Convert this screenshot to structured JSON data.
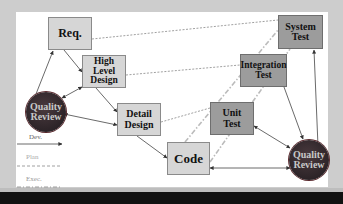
{
  "diagram": {
    "type": "V-model software development process",
    "nodes": {
      "req": {
        "label": "Req."
      },
      "high_level_design": {
        "label_line1": "High Level",
        "label_line2": "Design"
      },
      "detail_design": {
        "label_line1": "Detail",
        "label_line2": "Design"
      },
      "code": {
        "label": "Code"
      },
      "unit_test": {
        "label_line1": "Unit",
        "label_line2": "Test"
      },
      "integration_test": {
        "label_line1": "Integration",
        "label_line2": "Test"
      },
      "system_test": {
        "label_line1": "System",
        "label_line2": "Test"
      },
      "quality_review_left": {
        "label_line1": "Quality",
        "label_line2": "Review"
      },
      "quality_review_right": {
        "label_line1": "Quality",
        "label_line2": "Review"
      }
    },
    "legend": [
      {
        "label": "Dev.",
        "style": "solid-arrow"
      },
      {
        "label": "Plan",
        "style": "dashed"
      },
      {
        "label": "Exec.",
        "style": "dash-dot"
      }
    ],
    "edges": [
      {
        "from": "Req.",
        "to": "High Level Design",
        "style": "solid-arrow"
      },
      {
        "from": "High Level Design",
        "to": "Detail Design",
        "style": "solid-arrow"
      },
      {
        "from": "Detail Design",
        "to": "Code",
        "style": "solid-arrow"
      },
      {
        "from": "Quality Review (left)",
        "to": "Req.",
        "style": "solid-arrow"
      },
      {
        "from": "Quality Review (left)",
        "to": "High Level Design",
        "style": "double-arrow"
      },
      {
        "from": "Quality Review (left)",
        "to": "Detail Design",
        "style": "double-arrow"
      },
      {
        "from": "Code",
        "to": "Quality Review (right)",
        "style": "double-arrow"
      },
      {
        "from": "Unit Test",
        "to": "Quality Review (right)",
        "style": "double-arrow"
      },
      {
        "from": "Integration Test",
        "to": "Quality Review (right)",
        "style": "solid-arrow"
      },
      {
        "from": "Quality Review (right)",
        "to": "System Test",
        "style": "solid-arrow"
      },
      {
        "from": "Req.",
        "to": "System Test",
        "style": "dashed"
      },
      {
        "from": "High Level Design",
        "to": "Integration Test",
        "style": "dashed"
      },
      {
        "from": "Detail Design",
        "to": "Unit Test",
        "style": "dashed"
      },
      {
        "from": "Code",
        "to": "System Test",
        "style": "dash-dot"
      },
      {
        "from": "Code",
        "to": "Integration Test",
        "style": "dash-dot"
      }
    ],
    "colors": {
      "dev_box": "#d6d6d6",
      "test_box": "#9c9c9c",
      "review_circle": "#2f2629",
      "background": "#cdcdcd",
      "panel": "#ffffff"
    }
  }
}
